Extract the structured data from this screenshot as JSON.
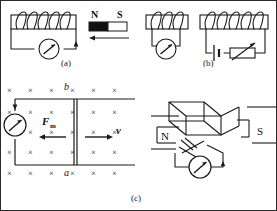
{
  "figure": {
    "width": 277,
    "height": 211,
    "background": "#ffffff",
    "stroke_color": "#1a1a1a",
    "border_color": "#2a2a2a"
  },
  "panels": [
    {
      "id": "a",
      "caption": "(a)",
      "description": "Bar magnet moving toward a solenoid connected to a galvanometer",
      "elements": {
        "coil_turns": 5,
        "magnet": {
          "north_label": "N",
          "south_label": "S",
          "north_fill": "#111111",
          "south_fill": "#ffffff",
          "motion_arrow_direction": "left"
        },
        "meter": {
          "name": "galvanometer",
          "shape": "circle-with-needle"
        }
      }
    },
    {
      "id": "b",
      "caption": "(b)",
      "description": "Two solenoids: left one with galvanometer, right one with battery and rheostat",
      "elements": {
        "left_coil_turns": 3,
        "right_coil_turns": 5,
        "meter": {
          "name": "galvanometer",
          "shape": "circle-with-needle"
        },
        "battery": {
          "name": "battery-cell",
          "shape": "long-short-plate"
        },
        "rheostat": {
          "name": "variable-resistor",
          "shape": "box-with-diagonal-arrow"
        }
      }
    },
    {
      "id": "c",
      "caption": "(c)",
      "description": "Conducting rod ab sliding on rails in a uniform magnetic field into the page",
      "elements": {
        "field_symbol": "×",
        "field_direction": "into-page",
        "field_rows": 5,
        "field_cols": 6,
        "rod_top_label": "b",
        "rod_bottom_label": "a",
        "force_label": "F",
        "force_subscript": "m",
        "force_arrow_direction": "left",
        "velocity_label": "v",
        "velocity_arrow_direction": "right",
        "meter": {
          "name": "galvanometer",
          "shape": "circle-with-needle"
        }
      }
    },
    {
      "id": "d",
      "caption": "",
      "description": "Rotating rectangular coil between magnet pole pieces connected to a galvanometer",
      "elements": {
        "north_label": "N",
        "south_label": "S",
        "meter": {
          "name": "galvanometer",
          "shape": "circle-with-needle"
        }
      }
    }
  ],
  "field_grid": {
    "marks": [
      [
        "×",
        "×",
        "×",
        "×",
        "×",
        "×"
      ],
      [
        "×",
        "×",
        "×",
        "×",
        "×",
        "×"
      ],
      [
        "×",
        "×",
        "×",
        "×",
        "×",
        "×"
      ],
      [
        "×",
        "×",
        "×",
        "×",
        "×",
        "×"
      ],
      [
        "×",
        "×",
        "×",
        "×",
        "×",
        "×"
      ]
    ]
  }
}
